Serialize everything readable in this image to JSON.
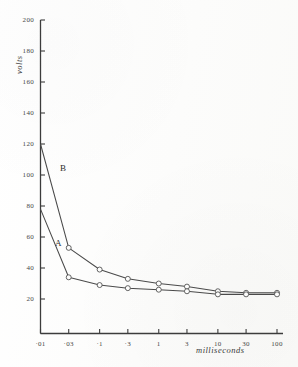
{
  "chart_data": {
    "type": "line",
    "title": "",
    "xlabel": "milliseconds",
    "ylabel": "volts",
    "xscale": "log",
    "xlim": [
      0.01,
      100
    ],
    "ylim": [
      20,
      200
    ],
    "grid": false,
    "legend": "inline-curve-labels",
    "x": [
      0.01,
      0.03,
      0.1,
      0.3,
      1,
      3,
      10,
      30,
      100
    ],
    "xtick_labels": [
      "·01",
      "·03",
      "·1",
      "·3",
      "1",
      "3",
      "10",
      "30",
      "100"
    ],
    "ytick_values": [
      200,
      180,
      160,
      140,
      120,
      100,
      80,
      60,
      40,
      20
    ],
    "ytick_labels": [
      "200",
      "180",
      "160",
      "140",
      "120",
      "100",
      "80",
      "60",
      "40",
      "20"
    ],
    "series": [
      {
        "name": "B",
        "label": "B",
        "values": [
          120,
          53,
          39,
          33,
          30,
          28,
          25,
          24,
          24
        ]
      },
      {
        "name": "A",
        "label": "A",
        "values": [
          78,
          34,
          29,
          27,
          26,
          25,
          23,
          23,
          23
        ]
      }
    ],
    "annotations": [
      {
        "text": "B",
        "series": "B"
      },
      {
        "text": "A",
        "series": "A"
      }
    ],
    "marker": "open-circle",
    "line_color": "#4a4a4a",
    "axis_color": "#3c3c3c"
  }
}
